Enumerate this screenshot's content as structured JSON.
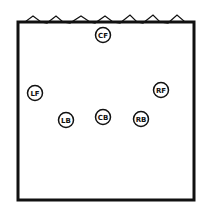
{
  "diagram": {
    "title": "",
    "court": {
      "x": 18,
      "y": 22,
      "width": 177,
      "height": 178,
      "net": "top"
    },
    "positions": [
      {
        "id": "cf",
        "label": "CF",
        "x": 103,
        "y": 35
      },
      {
        "id": "lf",
        "label": "LF",
        "x": 35,
        "y": 93
      },
      {
        "id": "rf",
        "label": "RF",
        "x": 161,
        "y": 90
      },
      {
        "id": "lb",
        "label": "LB",
        "x": 66,
        "y": 120
      },
      {
        "id": "cb",
        "label": "CB",
        "x": 103,
        "y": 117
      },
      {
        "id": "rb",
        "label": "RB",
        "x": 141,
        "y": 119
      }
    ]
  }
}
